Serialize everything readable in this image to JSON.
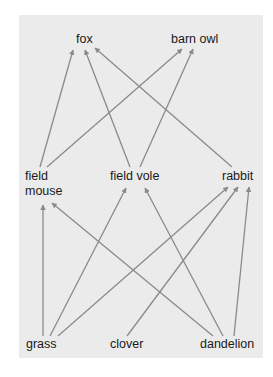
{
  "diagram": {
    "type": "food-web",
    "background_color": "#ebebeb",
    "arrow_color": "#8a8a8a",
    "nodes": {
      "fox": {
        "label": "fox",
        "level": "top-predator"
      },
      "barn_owl": {
        "label": "barn owl",
        "level": "top-predator"
      },
      "field_mouse": {
        "label_line1": "field",
        "label_line2": "mouse",
        "level": "primary-consumer"
      },
      "field_vole": {
        "label": "field vole",
        "level": "primary-consumer"
      },
      "rabbit": {
        "label": "rabbit",
        "level": "primary-consumer"
      },
      "grass": {
        "label": "grass",
        "level": "producer"
      },
      "clover": {
        "label": "clover",
        "level": "producer"
      },
      "dandelion": {
        "label": "dandelion",
        "level": "producer"
      }
    },
    "edges": [
      {
        "from": "field mouse",
        "to": "fox"
      },
      {
        "from": "field vole",
        "to": "fox"
      },
      {
        "from": "rabbit",
        "to": "fox"
      },
      {
        "from": "field mouse",
        "to": "barn owl"
      },
      {
        "from": "field vole",
        "to": "barn owl"
      },
      {
        "from": "grass",
        "to": "field mouse"
      },
      {
        "from": "dandelion",
        "to": "field mouse"
      },
      {
        "from": "grass",
        "to": "field vole"
      },
      {
        "from": "dandelion",
        "to": "field vole"
      },
      {
        "from": "grass",
        "to": "rabbit"
      },
      {
        "from": "clover",
        "to": "rabbit"
      },
      {
        "from": "dandelion",
        "to": "rabbit"
      }
    ]
  }
}
